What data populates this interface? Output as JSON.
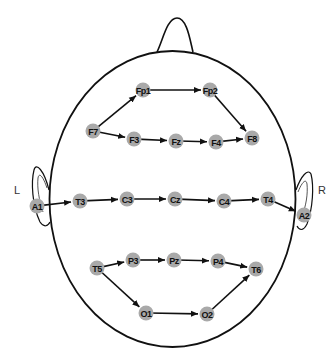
{
  "diagram": {
    "side_labels": {
      "left": "L",
      "right": "R"
    },
    "colors": {
      "electrode_fill": "#a9a9a9",
      "line": "#111111",
      "background": "#ffffff"
    },
    "electrodes": [
      {
        "id": "Fp1",
        "label": "Fp1",
        "x": 143,
        "y": 90
      },
      {
        "id": "Fp2",
        "label": "Fp2",
        "x": 210,
        "y": 90
      },
      {
        "id": "F7",
        "label": "F7",
        "x": 93,
        "y": 131
      },
      {
        "id": "F3",
        "label": "F3",
        "x": 134,
        "y": 139
      },
      {
        "id": "Fz",
        "label": "Fz",
        "x": 176,
        "y": 141
      },
      {
        "id": "F4",
        "label": "F4",
        "x": 216,
        "y": 142
      },
      {
        "id": "F8",
        "label": "F8",
        "x": 252,
        "y": 138
      },
      {
        "id": "A1",
        "label": "A1",
        "x": 37,
        "y": 206
      },
      {
        "id": "T3",
        "label": "T3",
        "x": 80,
        "y": 201
      },
      {
        "id": "C3",
        "label": "C3",
        "x": 127,
        "y": 199
      },
      {
        "id": "Cz",
        "label": "Cz",
        "x": 175,
        "y": 199
      },
      {
        "id": "C4",
        "label": "C4",
        "x": 224,
        "y": 201
      },
      {
        "id": "T4",
        "label": "T4",
        "x": 268,
        "y": 199
      },
      {
        "id": "A2",
        "label": "A2",
        "x": 304,
        "y": 215
      },
      {
        "id": "T5",
        "label": "T5",
        "x": 97,
        "y": 268
      },
      {
        "id": "P3",
        "label": "P3",
        "x": 133,
        "y": 260
      },
      {
        "id": "Pz",
        "label": "Pz",
        "x": 174,
        "y": 260
      },
      {
        "id": "P4",
        "label": "P4",
        "x": 218,
        "y": 261
      },
      {
        "id": "T6",
        "label": "T6",
        "x": 256,
        "y": 269
      },
      {
        "id": "O1",
        "label": "O1",
        "x": 146,
        "y": 313
      },
      {
        "id": "O2",
        "label": "O2",
        "x": 207,
        "y": 314
      }
    ],
    "connections": [
      [
        "F7",
        "Fp1"
      ],
      [
        "Fp1",
        "Fp2"
      ],
      [
        "Fp2",
        "F8"
      ],
      [
        "F7",
        "F3"
      ],
      [
        "F3",
        "Fz"
      ],
      [
        "Fz",
        "F4"
      ],
      [
        "F4",
        "F8"
      ],
      [
        "A1",
        "T3"
      ],
      [
        "T3",
        "C3"
      ],
      [
        "C3",
        "Cz"
      ],
      [
        "Cz",
        "C4"
      ],
      [
        "C4",
        "T4"
      ],
      [
        "T4",
        "A2"
      ],
      [
        "T5",
        "P3"
      ],
      [
        "P3",
        "Pz"
      ],
      [
        "Pz",
        "P4"
      ],
      [
        "P4",
        "T6"
      ],
      [
        "T5",
        "O1"
      ],
      [
        "O1",
        "O2"
      ],
      [
        "O2",
        "T6"
      ]
    ]
  }
}
